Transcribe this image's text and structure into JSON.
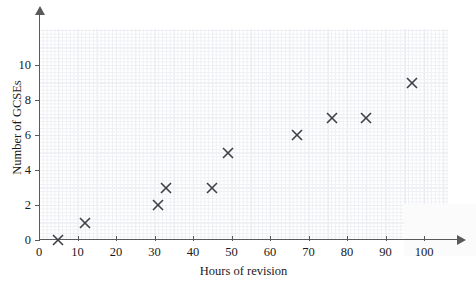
{
  "chart_data": {
    "type": "scatter",
    "title": "",
    "xlabel": "Hours of revision",
    "ylabel": "Number of GCSEs",
    "xlim": [
      0,
      110
    ],
    "ylim": [
      0,
      11.6
    ],
    "xticks": [
      0,
      10,
      20,
      30,
      40,
      50,
      60,
      70,
      80,
      90,
      100
    ],
    "yticks": [
      0,
      2,
      4,
      6,
      8,
      10
    ],
    "xticklabels": [
      "0",
      "10",
      "20",
      "30",
      "40",
      "50",
      "60",
      "70",
      "80",
      "90",
      "100"
    ],
    "yticklabels": [
      "0",
      "2",
      "4",
      "6",
      "8",
      "10"
    ],
    "grid": true,
    "legend": null,
    "marker": "x",
    "marker_color": "#3f3f46",
    "points": [
      {
        "x": 5,
        "y": 0
      },
      {
        "x": 12,
        "y": 1
      },
      {
        "x": 31,
        "y": 2
      },
      {
        "x": 33,
        "y": 3
      },
      {
        "x": 45,
        "y": 3
      },
      {
        "x": 49,
        "y": 5
      },
      {
        "x": 67,
        "y": 6
      },
      {
        "x": 76,
        "y": 7
      },
      {
        "x": 85,
        "y": 7
      },
      {
        "x": 97,
        "y": 9
      }
    ]
  },
  "axes": {
    "x_axis_name": "x-axis",
    "y_axis_name": "y-axis"
  },
  "colors": {
    "axis": "#5a5a5a",
    "grid_minor": "#eef0f4",
    "grid_major": "#e2e5eb",
    "text": "#1a1a1a",
    "marker": "#3f3f46"
  }
}
